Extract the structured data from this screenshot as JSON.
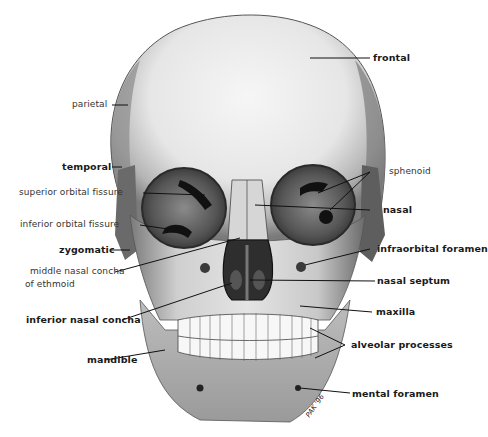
{
  "figure": {
    "colors": {
      "bone_light": "#f2f2f2",
      "bone_mid": "#b8b8b8",
      "bone_dark": "#6e6e6e",
      "cavity": "#3a3a3a",
      "ink": "#111111"
    },
    "artist_signature": "PAK '96"
  },
  "labels": {
    "left": [
      {
        "id": "parietal",
        "text": "parietal",
        "weight": "normal"
      },
      {
        "id": "temporal",
        "text": "temporal",
        "weight": "bold"
      },
      {
        "id": "superior_orbital_fissure",
        "text": "superior orbital fissure",
        "weight": "normal"
      },
      {
        "id": "inferior_orbital_fissure",
        "text": "inferior orbital fissure",
        "weight": "normal"
      },
      {
        "id": "zygomatic",
        "text": "zygomatic",
        "weight": "bold"
      },
      {
        "id": "middle_nasal_concha_1",
        "text": "middle nasal concha",
        "weight": "normal"
      },
      {
        "id": "middle_nasal_concha_2",
        "text": "of ethmoid",
        "weight": "normal"
      },
      {
        "id": "inferior_nasal_concha",
        "text": "inferior nasal concha",
        "weight": "bold"
      },
      {
        "id": "mandible",
        "text": "mandible",
        "weight": "bold"
      }
    ],
    "right": [
      {
        "id": "frontal",
        "text": "frontal",
        "weight": "bold"
      },
      {
        "id": "sphenoid",
        "text": "sphenoid",
        "weight": "normal"
      },
      {
        "id": "nasal",
        "text": "nasal",
        "weight": "bold"
      },
      {
        "id": "infraorbital_foramen",
        "text": "infraorbital foramen",
        "weight": "bold"
      },
      {
        "id": "nasal_septum",
        "text": "nasal septum",
        "weight": "bold"
      },
      {
        "id": "maxilla",
        "text": "maxilla",
        "weight": "bold"
      },
      {
        "id": "alveolar_processes",
        "text": "alveolar processes",
        "weight": "bold"
      },
      {
        "id": "mental_foramen",
        "text": "mental foramen",
        "weight": "bold"
      }
    ]
  }
}
